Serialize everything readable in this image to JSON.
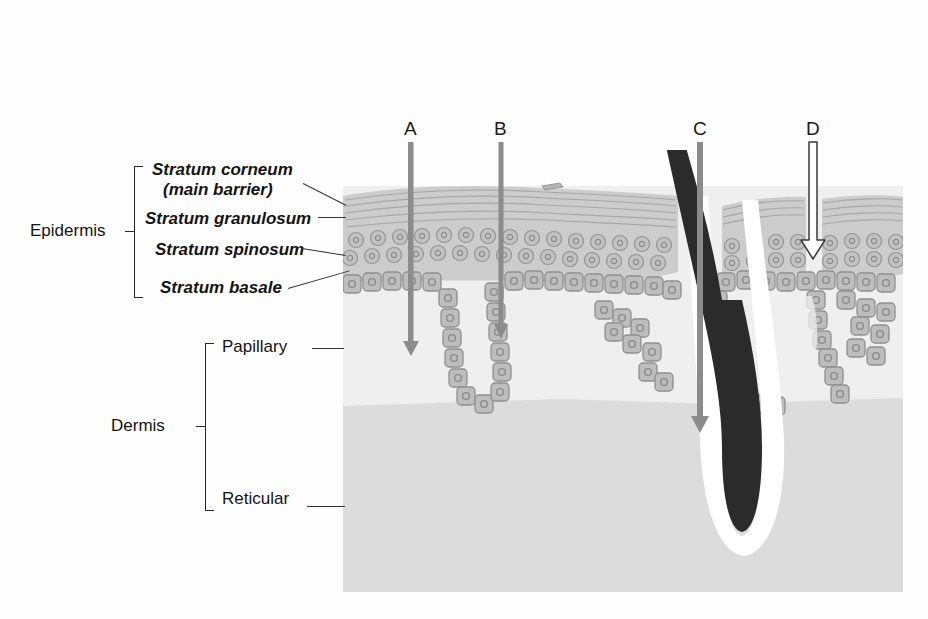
{
  "figure": {
    "type": "diagram",
    "background_color": "#fdfdfd"
  },
  "labels": {
    "epidermis": "Epidermis",
    "stratum_corneum_line1": "Stratum corneum",
    "stratum_corneum_line2": "(main barrier)",
    "stratum_granulosum": "Stratum granulosum",
    "stratum_spinosum": "Stratum spinosum",
    "stratum_basale": "Stratum basale",
    "dermis": "Dermis",
    "papillary": "Papillary",
    "reticular": "Reticular"
  },
  "arrows": [
    {
      "id": "A",
      "letter": "A",
      "style": "gray-solid",
      "x": 411,
      "top": 142,
      "tip": 355,
      "description": "gray arrow penetrating through epidermis into papillary dermis"
    },
    {
      "id": "B",
      "letter": "B",
      "style": "gray-solid",
      "x": 501,
      "top": 142,
      "tip": 338,
      "description": "gray arrow ending at the base of a rete ridge"
    },
    {
      "id": "C",
      "letter": "C",
      "style": "gray-solid",
      "x": 700,
      "top": 142,
      "tip": 432,
      "description": "gray arrow following the hair follicle shaft down to the bulb"
    },
    {
      "id": "D",
      "letter": "D",
      "style": "white-outlined",
      "x": 813,
      "top": 142,
      "tip": 258,
      "description": "white outlined arrow stopping within the epidermis"
    }
  ],
  "structures": {
    "hair_shaft": "hair shaft",
    "hair_bulb": "hair bulb",
    "follicle_sheath": "follicular sheath",
    "rete_ridge": "rete ridge",
    "dermal_papilla": "dermal papilla"
  },
  "colors": {
    "epidermis_cells": "#b9b9b9",
    "cell_outline": "#8e8e8e",
    "stratum_corneum": "#c4c4c4",
    "papillary_dermis": "#efefef",
    "reticular_dermis": "#dedede",
    "hair": "#2b2b2b",
    "arrow_gray": "#8c8c8c",
    "arrow_white": "#ffffff",
    "text": "#141414"
  },
  "geometry": {
    "block_left": 343,
    "block_right": 903,
    "block_top": 186,
    "block_bottom": 592,
    "dermis_split_y": 403
  }
}
